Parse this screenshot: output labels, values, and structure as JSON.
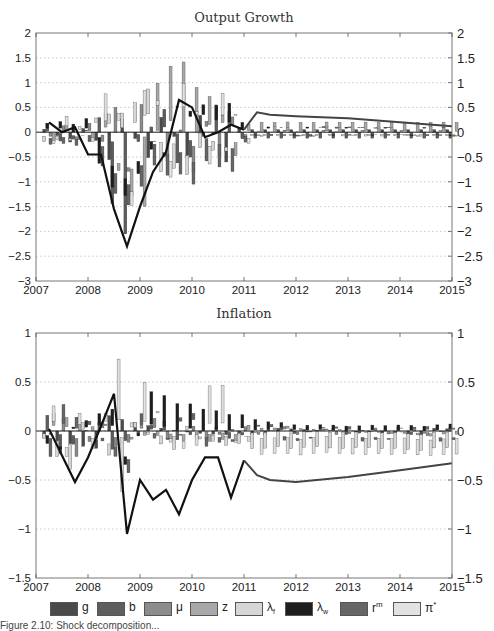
{
  "colors": {
    "g": "#4a4a4a",
    "b": "#5e5e5e",
    "mu": "#8c8c8c",
    "z": "#a8a8a8",
    "lambda_f": "#d6d6d6",
    "lambda_w": "#1e1e1e",
    "r_m": "#666666",
    "pi_star": "#e2e2e2",
    "line_history": "#111111",
    "line_forecast": "#444444"
  },
  "chart_data": [
    {
      "type": "bar",
      "title": "Output Growth",
      "xlabel": "",
      "ylabel": "",
      "x_ticks": [
        "2007",
        "2008",
        "2009",
        "2010",
        "2011",
        "2012",
        "2013",
        "2014",
        "2015"
      ],
      "y_ticks": [
        "2",
        "1.5",
        "1",
        "0.5",
        "0",
        "-0.5",
        "-1",
        "-1.5",
        "-2",
        "-2.5",
        "-3"
      ],
      "ylim": [
        -3,
        2
      ],
      "xlim": [
        2007,
        2015
      ],
      "grid": "horizontal dotted",
      "stacked": true,
      "series_names": [
        "g",
        "b",
        "μ",
        "z",
        "λf",
        "λw",
        "rm",
        "π*"
      ],
      "line": {
        "name": "Output growth (deviation)",
        "x": [
          2007.25,
          2007.5,
          2007.75,
          2008.0,
          2008.25,
          2008.5,
          2008.75,
          2009.0,
          2009.25,
          2009.5,
          2009.75,
          2010.0,
          2010.25,
          2010.5,
          2010.75,
          2011.0
        ],
        "y": [
          0.2,
          0.0,
          0.1,
          -0.45,
          -0.45,
          -1.55,
          -2.3,
          -1.5,
          -0.8,
          -0.4,
          0.65,
          0.5,
          -0.1,
          0.0,
          0.15,
          0.05
        ]
      },
      "forecast_line": {
        "x": [
          2011.0,
          2011.25,
          2011.5,
          2012.0,
          2013.0,
          2014.0,
          2015.0
        ],
        "y": [
          0.05,
          0.4,
          0.35,
          0.32,
          0.28,
          0.2,
          0.12
        ]
      },
      "notable_bars": [
        {
          "x": 2008.5,
          "value": -1.25,
          "shock": "b"
        },
        {
          "x": 2008.65,
          "value": -2.05,
          "shock": "b"
        },
        {
          "x": 2008.95,
          "value": -1.4,
          "shock": "z"
        },
        {
          "x": 2009.25,
          "value": 0.95,
          "shock": "z"
        },
        {
          "x": 2009.5,
          "value": 1.1,
          "shock": "z"
        },
        {
          "x": 2009.75,
          "value": 1.4,
          "shock": "z"
        },
        {
          "x": 2010.0,
          "value": 0.9,
          "shock": "z"
        },
        {
          "x": 2010.6,
          "value": 0.55,
          "shock": "b"
        },
        {
          "x": 2010.65,
          "value": -0.6,
          "shock": "g"
        }
      ]
    },
    {
      "type": "bar",
      "title": "Inflation",
      "xlabel": "",
      "ylabel": "",
      "x_ticks": [
        "2007",
        "2008",
        "2009",
        "2010",
        "2011",
        "2012",
        "2013",
        "2014",
        "2015"
      ],
      "y_ticks": [
        "1",
        "0.5",
        "0",
        "-0.5",
        "-1",
        "-1.5"
      ],
      "ylim": [
        -1.5,
        1
      ],
      "xlim": [
        2007,
        2015
      ],
      "grid": "horizontal dotted",
      "stacked": true,
      "series_names": [
        "g",
        "b",
        "μ",
        "z",
        "λf",
        "λw",
        "rm",
        "π*"
      ],
      "line": {
        "name": "Inflation (deviation)",
        "x": [
          2007.25,
          2007.5,
          2007.75,
          2008.0,
          2008.25,
          2008.5,
          2008.75,
          2009.0,
          2009.25,
          2009.5,
          2009.75,
          2010.0,
          2010.25,
          2010.5,
          2010.75,
          2011.0
        ],
        "y": [
          0.02,
          -0.25,
          -0.52,
          -0.27,
          0.05,
          0.38,
          -1.05,
          -0.5,
          -0.7,
          -0.6,
          -0.85,
          -0.5,
          -0.27,
          -0.27,
          -0.68,
          -0.3
        ]
      },
      "forecast_line": {
        "x": [
          2011.0,
          2011.25,
          2011.5,
          2012.0,
          2013.0,
          2014.0,
          2015.0
        ],
        "y": [
          -0.3,
          -0.45,
          -0.5,
          -0.52,
          -0.47,
          -0.4,
          -0.33
        ]
      },
      "notable_bars": [
        {
          "x": 2008.55,
          "value": 0.62,
          "shock": "π*"
        },
        {
          "x": 2008.8,
          "value": -0.55,
          "shock": "λf"
        },
        {
          "x": 2009.0,
          "value": 0.4,
          "shock": "π*"
        },
        {
          "x": 2009.5,
          "value": 0.32,
          "shock": "λw"
        },
        {
          "x": 2010.25,
          "value": 0.38,
          "shock": "π*"
        },
        {
          "x": 2010.5,
          "value": 0.38,
          "shock": "π*"
        }
      ]
    }
  ],
  "legend": [
    {
      "key": "g",
      "label": "g",
      "sub": "",
      "sup": ""
    },
    {
      "key": "b",
      "label": "b",
      "sub": "",
      "sup": ""
    },
    {
      "key": "mu",
      "label": "μ",
      "sub": "",
      "sup": ""
    },
    {
      "key": "z",
      "label": "z",
      "sub": "",
      "sup": ""
    },
    {
      "key": "lambda_f",
      "label": "λ",
      "sub": "f",
      "sup": ""
    },
    {
      "key": "lambda_w",
      "label": "λ",
      "sub": "w",
      "sup": ""
    },
    {
      "key": "r_m",
      "label": "r",
      "sub": "",
      "sup": "m"
    },
    {
      "key": "pi_star",
      "label": "π",
      "sub": "",
      "sup": "*"
    }
  ],
  "caption": "Figure 2.10: Shock decomposition..."
}
